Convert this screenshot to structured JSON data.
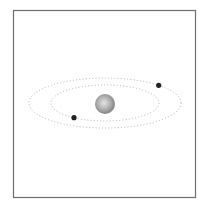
{
  "diagram": {
    "colors": {
      "background": "#ffffff",
      "frame": "#6e6e6e",
      "orbit": "#b4b4b4",
      "star_light": "#e6e6e6",
      "star_mid": "#a8a8a8",
      "star_dark": "#7a7a7a",
      "planet": "#222222"
    },
    "star": {
      "name": "central-star"
    },
    "orbits": [
      {
        "name": "inner-orbit",
        "style": "dotted"
      },
      {
        "name": "outer-orbit",
        "style": "dotted"
      }
    ],
    "planets": [
      {
        "name": "planet-outer",
        "orbit": "outer-orbit",
        "angle_deg": -45
      },
      {
        "name": "planet-inner",
        "orbit": "inner-orbit",
        "angle_deg": 125
      }
    ]
  }
}
